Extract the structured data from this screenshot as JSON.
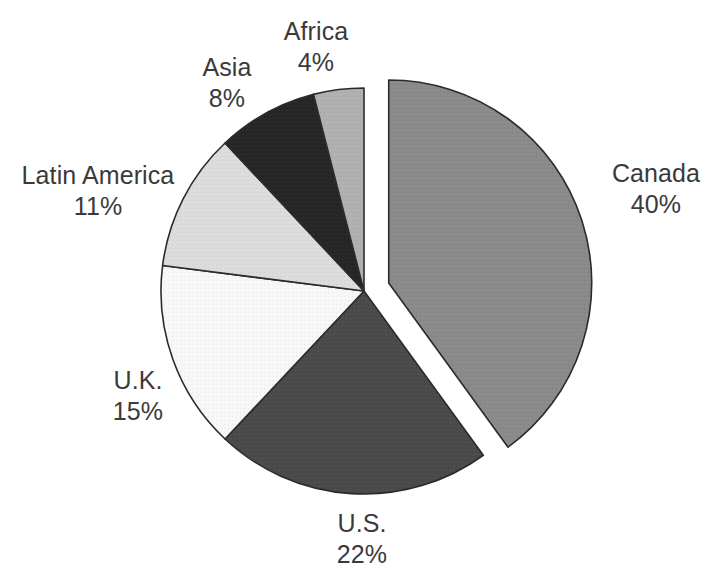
{
  "chart_data": {
    "type": "pie",
    "title": "",
    "subtitle": "",
    "xlabel": "",
    "ylabel": "",
    "legend_position": "none",
    "grid": false,
    "units": "percent",
    "total": 100,
    "start_angle_deg": 0,
    "direction": "clockwise",
    "exploded_slice": "Canada",
    "categories": [
      "Canada",
      "U.S.",
      "U.K.",
      "Latin America",
      "Asia",
      "Africa"
    ],
    "values": [
      40,
      22,
      15,
      11,
      8,
      4
    ],
    "value_labels": [
      "40%",
      "22%",
      "15%",
      "11%",
      "8%",
      "4%"
    ],
    "slices": [
      {
        "name": "Canada",
        "value": 40,
        "value_label": "40%",
        "color": "#8a8a8a",
        "exploded": true
      },
      {
        "name": "U.S.",
        "value": 22,
        "value_label": "22%",
        "color": "#4a4a4a",
        "exploded": false
      },
      {
        "name": "U.K.",
        "value": 15,
        "value_label": "15%",
        "color": "#f7f7f7",
        "exploded": false
      },
      {
        "name": "Latin America",
        "value": 11,
        "value_label": "11%",
        "color": "#dcdcdc",
        "exploded": false
      },
      {
        "name": "Asia",
        "value": 8,
        "value_label": "8%",
        "color": "#262626",
        "exploded": false
      },
      {
        "name": "Africa",
        "value": 4,
        "value_label": "4%",
        "color": "#b0b0b0",
        "exploded": false
      }
    ]
  },
  "labels": {
    "africa": {
      "name": "Africa",
      "value": "4%"
    },
    "asia": {
      "name": "Asia",
      "value": "8%"
    },
    "latin_america": {
      "name": "Latin America",
      "value": "11%"
    },
    "uk": {
      "name": "U.K.",
      "value": "15%"
    },
    "us": {
      "name": "U.S.",
      "value": "22%"
    },
    "canada": {
      "name": "Canada",
      "value": "40%"
    }
  },
  "style": {
    "background": "#ffffff",
    "outline_color": "#2b2b2b",
    "text_color": "#3a3a3a"
  }
}
